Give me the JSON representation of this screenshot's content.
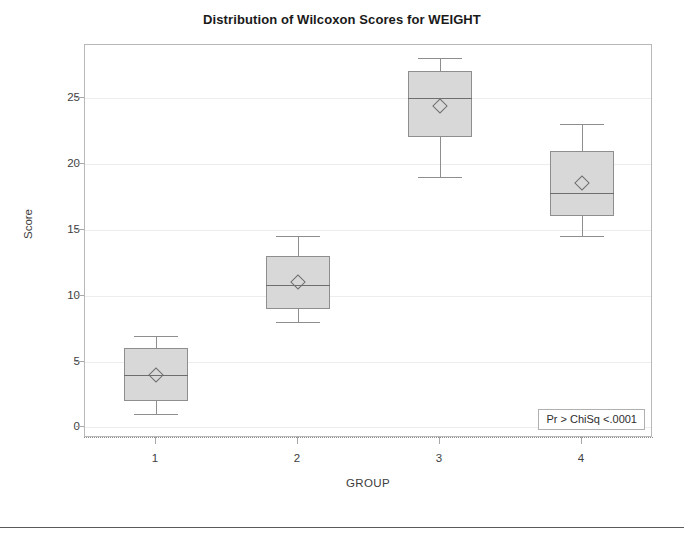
{
  "chart_data": {
    "type": "box",
    "title": "Distribution of Wilcoxon Scores for WEIGHT",
    "xlabel": "GROUP",
    "ylabel": "Score",
    "categories": [
      "1",
      "2",
      "3",
      "4"
    ],
    "ytick_labels": [
      "0",
      "5",
      "10",
      "15",
      "20",
      "25"
    ],
    "ytick_values": [
      0,
      5,
      10,
      15,
      20,
      25
    ],
    "ylim": [
      -0.8,
      29.0
    ],
    "grid": true,
    "legend": "none",
    "boxes": [
      {
        "group": "1",
        "whisker_low": 1.0,
        "q1": 2.0,
        "median": 4.0,
        "q3": 6.0,
        "whisker_high": 6.9,
        "mean": 4.0
      },
      {
        "group": "2",
        "whisker_low": 8.0,
        "q1": 9.0,
        "median": 10.8,
        "q3": 13.0,
        "whisker_high": 14.5,
        "mean": 11.0
      },
      {
        "group": "3",
        "whisker_low": 19.0,
        "q1": 22.0,
        "median": 25.0,
        "q3": 27.0,
        "whisker_high": 28.0,
        "mean": 24.4
      },
      {
        "group": "4",
        "whisker_low": 14.5,
        "q1": 16.0,
        "median": 17.8,
        "q3": 21.0,
        "whisker_high": 23.0,
        "mean": 18.5
      }
    ],
    "annotations": [
      {
        "name": "p-value-box",
        "label": "Pr > ChiSq",
        "value": "<.0001",
        "text": "Pr > ChiSq  <.0001"
      }
    ],
    "colors": {
      "box_fill": "#d8d8d8",
      "box_border": "#8e8e8e",
      "median": "#6e6e6e",
      "grid": "#ededed",
      "frame": "#b8b8b8",
      "text": "#3d3d3d",
      "title": "#1a1a1a"
    }
  }
}
